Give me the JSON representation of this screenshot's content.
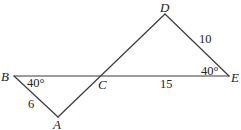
{
  "diagram": {
    "type": "geometry",
    "colors": {
      "line": "#3a3a3a",
      "text": "#222222",
      "background": "#ffffff"
    },
    "vertices": {
      "A": {
        "label": "A",
        "x": 58,
        "y": 117
      },
      "B": {
        "label": "B",
        "x": 14,
        "y": 76
      },
      "C": {
        "label": "C",
        "x": 100,
        "y": 76
      },
      "D": {
        "label": "D",
        "x": 165,
        "y": 14
      },
      "E": {
        "label": "E",
        "x": 229,
        "y": 76
      }
    },
    "segments": [
      {
        "from": "B",
        "to": "E"
      },
      {
        "from": "A",
        "to": "D"
      },
      {
        "from": "B",
        "to": "A"
      },
      {
        "from": "D",
        "to": "E"
      }
    ],
    "measures": {
      "angle_B": "40°",
      "angle_E": "40°",
      "side_AB": "6",
      "side_CE": "15",
      "side_DE": "10"
    }
  }
}
